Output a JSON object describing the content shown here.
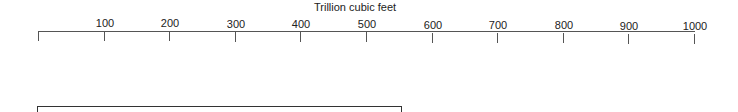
{
  "chart_data": {
    "type": "bar",
    "orientation": "horizontal",
    "title": "",
    "xlabel": "Trillion cubic feet",
    "ylabel": "",
    "xlim": [
      0,
      1000
    ],
    "ticks": [
      100,
      200,
      300,
      400,
      500,
      600,
      700,
      800,
      900,
      1000
    ],
    "tick_labels": [
      "100",
      "200",
      "300",
      "400",
      "500",
      "600",
      "700",
      "800",
      "900",
      "1000"
    ],
    "grid": false,
    "legend": null,
    "categories": [
      ""
    ],
    "values": [
      553
    ],
    "note": "Only the top edge of a single bar is visible at the bottom of the cropped image"
  },
  "axis": {
    "title": "Trillion cubic feet",
    "tick_labels": [
      "100",
      "200",
      "300",
      "400",
      "500",
      "600",
      "700",
      "800",
      "900",
      "1000"
    ]
  }
}
